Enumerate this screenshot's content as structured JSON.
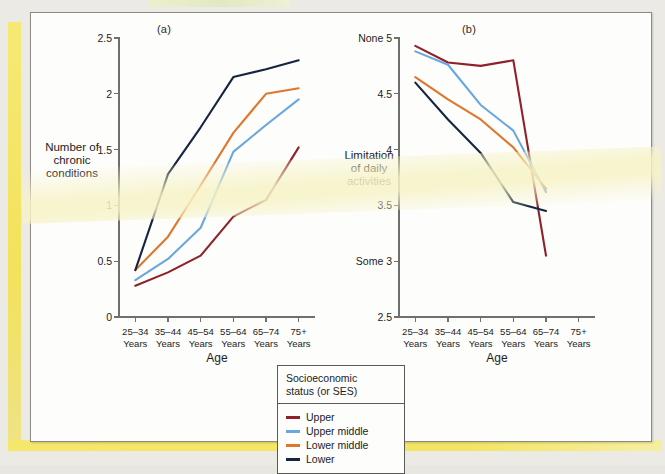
{
  "figure": {
    "panels": [
      {
        "id": "a",
        "label": "(a)",
        "ylabel": "Number of\nchronic\nconditions",
        "xlabel": "Age"
      },
      {
        "id": "b",
        "label": "(b)",
        "ylabel": "Limitation\nof daily\nactivities",
        "xlabel": "Age"
      }
    ]
  },
  "legend": {
    "title": "Socioeconomic\nstatus (or SES)",
    "items": [
      {
        "label": "Upper",
        "color": "#8e2129"
      },
      {
        "label": "Upper middle",
        "color": "#6aa7de"
      },
      {
        "label": "Lower middle",
        "color": "#e0762b"
      },
      {
        "label": "Lower",
        "color": "#15253f"
      }
    ]
  },
  "chart_data": [
    {
      "type": "line",
      "panel": "a",
      "title": "(a)",
      "xlabel": "Age",
      "ylabel": "Number of chronic conditions",
      "categories": [
        "25–34\nYears",
        "35–44\nYears",
        "45–54\nYears",
        "55–64\nYears",
        "65–74\nYears",
        "75+\nYears"
      ],
      "tick_labels": [
        "25–34 Years",
        "35–44 Years",
        "45–54 Years",
        "55–64 Years",
        "65–74 Years",
        "75+ Years"
      ],
      "ylim": [
        0,
        2.5
      ],
      "ytick_values": [
        0,
        0.5,
        1,
        1.5,
        2,
        2.5
      ],
      "ytick_labels": [
        "0",
        "0.5",
        "1",
        "1.5",
        "2",
        "2.5"
      ],
      "grid": false,
      "legend_position": "below-center",
      "series": [
        {
          "name": "Upper",
          "color": "#8e2129",
          "values": [
            0.28,
            0.4,
            0.55,
            0.9,
            1.05,
            1.52
          ]
        },
        {
          "name": "Upper middle",
          "color": "#6aa7de",
          "values": [
            0.33,
            0.52,
            0.8,
            1.48,
            1.72,
            1.95
          ]
        },
        {
          "name": "Lower middle",
          "color": "#e0762b",
          "values": [
            0.42,
            0.72,
            1.18,
            1.65,
            2.0,
            2.05
          ]
        },
        {
          "name": "Lower",
          "color": "#15253f",
          "values": [
            0.42,
            1.28,
            1.7,
            2.15,
            2.22,
            2.3
          ]
        }
      ]
    },
    {
      "type": "line",
      "panel": "b",
      "title": "(b)",
      "xlabel": "Age",
      "ylabel": "Limitation of daily activities",
      "categories": [
        "25–34\nYears",
        "35–44\nYears",
        "45–54\nYears",
        "55–64\nYears",
        "65–74\nYears",
        "75+\nYears"
      ],
      "tick_labels": [
        "25–34 Years",
        "35–44 Years",
        "45–54 Years",
        "55–64 Years",
        "65–74 Years",
        "75+ Years"
      ],
      "ylim": [
        2.5,
        5
      ],
      "ytick_values": [
        2.5,
        3,
        3.5,
        4,
        4.5,
        5
      ],
      "ytick_labels": [
        "2.5",
        "3",
        "3.5",
        "4",
        "4.5",
        "5"
      ],
      "ytick_words": {
        "5": "None",
        "3": "Some"
      },
      "grid": false,
      "legend_position": "below-center",
      "note": "Series end at the 65–74 Years category; no data plotted at 75+ Years.",
      "series": [
        {
          "name": "Upper",
          "color": "#8e2129",
          "values": [
            4.93,
            4.78,
            4.75,
            4.8,
            3.05
          ]
        },
        {
          "name": "Upper middle",
          "color": "#6aa7de",
          "values": [
            4.88,
            4.76,
            4.4,
            4.17,
            3.62
          ]
        },
        {
          "name": "Lower middle",
          "color": "#e0762b",
          "values": [
            4.65,
            4.45,
            4.27,
            4.02,
            3.65
          ]
        },
        {
          "name": "Lower",
          "color": "#15253f",
          "values": [
            4.6,
            4.27,
            3.97,
            3.53,
            3.45
          ]
        }
      ]
    }
  ]
}
